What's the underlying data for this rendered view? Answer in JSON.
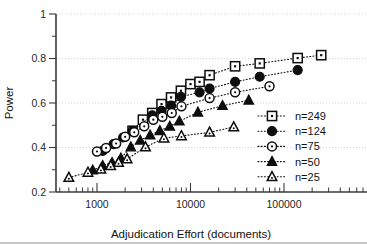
{
  "chart_data": {
    "type": "scatter",
    "title": "",
    "xlabel": "Adjudication Effort (documents)",
    "ylabel": "Power",
    "xscale": "log",
    "yscale": "linear",
    "xlim": [
      400,
      400000
    ],
    "ylim": [
      0.2,
      1.0
    ],
    "xticks": [
      1000,
      10000,
      100000
    ],
    "xtick_labels": [
      "1000",
      "10000",
      "100000"
    ],
    "yticks": [
      0.2,
      0.4,
      0.6,
      0.8,
      1
    ],
    "ytick_labels": [
      "0.2",
      "0.4",
      "0.6",
      "0.8",
      "1"
    ],
    "grid": "horizontal-dotted",
    "legend_position": "right-middle",
    "series": [
      {
        "name": "n=249",
        "marker": "open-square",
        "points": [
          [
            2400,
            0.475
          ],
          [
            3100,
            0.525
          ],
          [
            3900,
            0.555
          ],
          [
            4900,
            0.595
          ],
          [
            6200,
            0.625
          ],
          [
            7900,
            0.655
          ],
          [
            10000,
            0.685
          ],
          [
            12500,
            0.695
          ],
          [
            16000,
            0.725
          ],
          [
            30000,
            0.765
          ],
          [
            55000,
            0.778
          ],
          [
            140000,
            0.802
          ],
          [
            250000,
            0.815
          ]
        ]
      },
      {
        "name": "n=124",
        "marker": "filled-circle",
        "points": [
          [
            1150,
            0.385
          ],
          [
            1500,
            0.415
          ],
          [
            1900,
            0.445
          ],
          [
            2400,
            0.475
          ],
          [
            3900,
            0.545
          ],
          [
            4900,
            0.565
          ],
          [
            6200,
            0.588
          ],
          [
            7900,
            0.628
          ],
          [
            12500,
            0.648
          ],
          [
            16000,
            0.665
          ],
          [
            30000,
            0.695
          ],
          [
            55000,
            0.718
          ],
          [
            140000,
            0.748
          ]
        ]
      },
      {
        "name": "n=75",
        "marker": "open-circle",
        "points": [
          [
            1000,
            0.382
          ],
          [
            1250,
            0.398
          ],
          [
            1600,
            0.418
          ],
          [
            2000,
            0.448
          ],
          [
            2500,
            0.468
          ],
          [
            3200,
            0.495
          ],
          [
            4000,
            0.525
          ],
          [
            5000,
            0.538
          ],
          [
            6300,
            0.555
          ],
          [
            8000,
            0.585
          ],
          [
            16000,
            0.622
          ],
          [
            30000,
            0.648
          ],
          [
            70000,
            0.675
          ]
        ]
      },
      {
        "name": "n=50",
        "marker": "filled-triangle",
        "points": [
          [
            900,
            0.298
          ],
          [
            1150,
            0.318
          ],
          [
            1450,
            0.332
          ],
          [
            1800,
            0.352
          ],
          [
            2300,
            0.402
          ],
          [
            2900,
            0.432
          ],
          [
            3700,
            0.455
          ],
          [
            4700,
            0.475
          ],
          [
            6000,
            0.495
          ],
          [
            7600,
            0.518
          ],
          [
            12000,
            0.558
          ],
          [
            22000,
            0.588
          ],
          [
            42000,
            0.612
          ]
        ]
      },
      {
        "name": "n=25",
        "marker": "open-triangle",
        "points": [
          [
            500,
            0.265
          ],
          [
            800,
            0.288
          ],
          [
            1100,
            0.302
          ],
          [
            1400,
            0.318
          ],
          [
            1700,
            0.332
          ],
          [
            2100,
            0.348
          ],
          [
            3300,
            0.402
          ],
          [
            5200,
            0.442
          ],
          [
            8000,
            0.452
          ],
          [
            16000,
            0.468
          ],
          [
            29000,
            0.492
          ]
        ]
      }
    ]
  },
  "legend": {
    "entries": [
      {
        "label": "n=249",
        "marker": "open-square"
      },
      {
        "label": "n=124",
        "marker": "filled-circle"
      },
      {
        "label": "n=75",
        "marker": "open-circle"
      },
      {
        "label": "n=50",
        "marker": "filled-triangle"
      },
      {
        "label": "n=25",
        "marker": "open-triangle"
      }
    ]
  },
  "colors": {
    "ink": "#0d0d0d",
    "axis": "#3a3a3a",
    "grid": "#c9c9c9",
    "background": "#ffffff"
  }
}
